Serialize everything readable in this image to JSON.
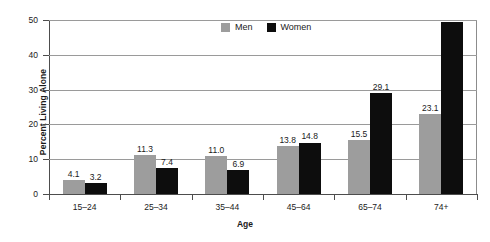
{
  "chart_data": {
    "type": "bar",
    "title": "",
    "xlabel": "Age",
    "ylabel": "Percent Living Alone",
    "categories": [
      "15–24",
      "25–34",
      "35–44",
      "45–64",
      "65–74",
      "74+"
    ],
    "series": [
      {
        "name": "Men",
        "color": "#9d9d9d",
        "values": [
          4.1,
          11.3,
          11.0,
          13.8,
          15.5,
          23.1
        ],
        "labels": [
          "4.1",
          "11.3",
          "11.0",
          "13.8",
          "15.5",
          "23.1"
        ]
      },
      {
        "name": "Women",
        "color": "#0d0d0d",
        "values": [
          3.2,
          7.4,
          6.9,
          14.8,
          29.1,
          49.4
        ],
        "labels": [
          "3.2",
          "7.4",
          "6.9",
          "14.8",
          "29.1",
          ""
        ]
      }
    ],
    "ylim": [
      0,
      50
    ],
    "yticks": [
      0,
      10,
      20,
      30,
      40,
      50
    ],
    "ytick_labels": [
      "0",
      "10",
      "20",
      "30",
      "40",
      "50"
    ],
    "grid": true,
    "legend_position": "top-center",
    "legend": [
      "Men",
      "Women"
    ]
  }
}
